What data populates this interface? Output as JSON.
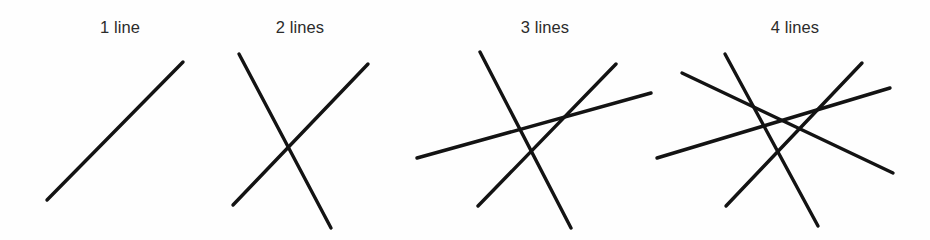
{
  "figure": {
    "background_color": "#fefefe",
    "stroke_color": "#131313",
    "label_color": "#2b2b2b",
    "width": 930,
    "height": 240
  },
  "panels": [
    {
      "id": "panel-1",
      "label": "1 line",
      "line_count": 1,
      "label_x": 120,
      "lines": [
        {
          "name": "line-1",
          "x1": 47,
          "y1": 200,
          "x2": 183,
          "y2": 62
        }
      ]
    },
    {
      "id": "panel-2",
      "label": "2 lines",
      "line_count": 2,
      "label_x": 300,
      "lines": [
        {
          "name": "line-1",
          "x1": 239,
          "y1": 54,
          "x2": 331,
          "y2": 228
        },
        {
          "name": "line-2",
          "x1": 233,
          "y1": 205,
          "x2": 368,
          "y2": 64
        }
      ]
    },
    {
      "id": "panel-3",
      "label": "3 lines",
      "line_count": 3,
      "label_x": 545,
      "lines": [
        {
          "name": "line-1",
          "x1": 480,
          "y1": 52,
          "x2": 571,
          "y2": 228
        },
        {
          "name": "line-2",
          "x1": 478,
          "y1": 206,
          "x2": 616,
          "y2": 64
        },
        {
          "name": "line-3",
          "x1": 417,
          "y1": 158,
          "x2": 651,
          "y2": 93
        }
      ]
    },
    {
      "id": "panel-4",
      "label": "4 lines",
      "line_count": 4,
      "label_x": 795,
      "lines": [
        {
          "name": "line-1",
          "x1": 725,
          "y1": 54,
          "x2": 818,
          "y2": 226
        },
        {
          "name": "line-2",
          "x1": 682,
          "y1": 73,
          "x2": 893,
          "y2": 173
        },
        {
          "name": "line-3",
          "x1": 726,
          "y1": 206,
          "x2": 862,
          "y2": 63
        },
        {
          "name": "line-4",
          "x1": 657,
          "y1": 158,
          "x2": 890,
          "y2": 88
        }
      ]
    }
  ]
}
